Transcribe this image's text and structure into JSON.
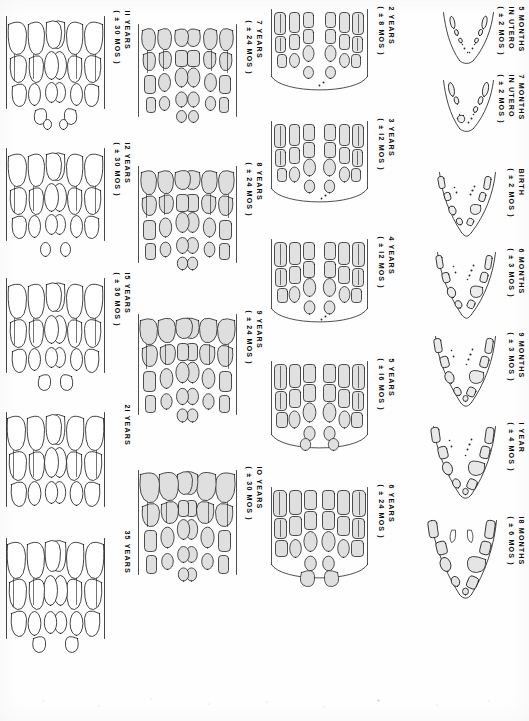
{
  "figure": {
    "orientation": "page rotated 90 degrees clockwise",
    "row_count": 4,
    "ink_color": "#111111",
    "paper_color": "#fefefe",
    "crown_fill": "#e2e2e2"
  },
  "rows": [
    {
      "row_index": 0,
      "name": "prenatal-and-infancy-row",
      "stages": [
        {
          "id": "s-5mo-utero",
          "line1": "5 MONTHS",
          "line2": "IN UTERO",
          "line3": "( ± 2 MOS )",
          "age_label": "5 MONTHS IN UTERO",
          "tolerance": "± 2 MOS"
        },
        {
          "id": "s-7mo-utero",
          "line1": "7 MONTHS",
          "line2": "IN UTERO",
          "line3": "( ± 2 MOS )",
          "age_label": "7 MONTHS IN UTERO",
          "tolerance": "± 2 MOS"
        },
        {
          "id": "s-birth",
          "line1": "BIRTH",
          "line2": "",
          "line3": "( ± 2 MOS )",
          "age_label": "BIRTH",
          "tolerance": "± 2 MOS"
        },
        {
          "id": "s-6mo",
          "line1": "6 MONTHS",
          "line2": "",
          "line3": "( ± 3 MOS )",
          "age_label": "6 MONTHS",
          "tolerance": "± 3 MOS"
        },
        {
          "id": "s-9mo",
          "line1": "9 MONTHS",
          "line2": "",
          "line3": "( ± 3 MOS )",
          "age_label": "9 MONTHS",
          "tolerance": "± 3 MOS"
        },
        {
          "id": "s-1yr",
          "line1": "I YEAR",
          "line2": "",
          "line3": "( ± 4 MOS )",
          "age_label": "I YEAR",
          "tolerance": "± 4 MOS"
        },
        {
          "id": "s-18mo",
          "line1": "I8 MONTHS",
          "line2": "",
          "line3": "( ± 6 MOS )",
          "age_label": "I8 MONTHS",
          "tolerance": "± 6 MOS"
        }
      ]
    },
    {
      "row_index": 1,
      "name": "early-childhood-row",
      "stages": [
        {
          "id": "s-2yr",
          "line1": "2 YEARS",
          "line2": "",
          "line3": "( ± 8 MOS )",
          "age_label": "2 YEARS",
          "tolerance": "± 8 MOS"
        },
        {
          "id": "s-3yr",
          "line1": "3 YEARS",
          "line2": "",
          "line3": "( ± I2 MOS )",
          "age_label": "3 YEARS",
          "tolerance": "± I2 MOS"
        },
        {
          "id": "s-4yr",
          "line1": "4 YEARS",
          "line2": "",
          "line3": "( ± I2 MOS )",
          "age_label": "4 YEARS",
          "tolerance": "± I2 MOS"
        },
        {
          "id": "s-5yr",
          "line1": "5 YEARS",
          "line2": "",
          "line3": "( ± I6 MOS )",
          "age_label": "5 YEARS",
          "tolerance": "± I6 MOS"
        },
        {
          "id": "s-6yr",
          "line1": "6 YEARS",
          "line2": "",
          "line3": "( ± 24 MOS )",
          "age_label": "6 YEARS",
          "tolerance": "± 24 MOS"
        }
      ]
    },
    {
      "row_index": 2,
      "name": "mixed-dentition-row",
      "stages": [
        {
          "id": "s-7yr",
          "line1": "7 YEARS",
          "line2": "",
          "line3": "( ± 24 MOS )",
          "age_label": "7 YEARS",
          "tolerance": "± 24 MOS"
        },
        {
          "id": "s-8yr",
          "line1": "8 YEARS",
          "line2": "",
          "line3": "( ± 24 MOS )",
          "age_label": "8 YEARS",
          "tolerance": "± 24 MOS"
        },
        {
          "id": "s-9yr",
          "line1": "9 YEARS",
          "line2": "",
          "line3": "( ± 24 MOS )",
          "age_label": "9 YEARS",
          "tolerance": "± 24 MOS"
        },
        {
          "id": "s-10yr",
          "line1": "IO YEARS",
          "line2": "",
          "line3": "( ± 30 MOS )",
          "age_label": "IO YEARS",
          "tolerance": "± 30 MOS"
        }
      ]
    },
    {
      "row_index": 3,
      "name": "permanent-dentition-row",
      "stages": [
        {
          "id": "s-11yr",
          "line1": "II YEARS",
          "line2": "",
          "line3": "( ± 30 MOS )",
          "age_label": "II YEARS",
          "tolerance": "± 30 MOS"
        },
        {
          "id": "s-12yr",
          "line1": "I2 YEARS",
          "line2": "",
          "line3": "( ± 30 MOS )",
          "age_label": "I2 YEARS",
          "tolerance": "± 30 MOS"
        },
        {
          "id": "s-15yr",
          "line1": "I5 YEARS",
          "line2": "",
          "line3": "( ± 36 MOS )",
          "age_label": "I5 YEARS",
          "tolerance": "± 36 MOS"
        },
        {
          "id": "s-21yr",
          "line1": "2I YEARS",
          "line2": "",
          "line3": "",
          "age_label": "2I YEARS",
          "tolerance": ""
        },
        {
          "id": "s-35yr",
          "line1": "35 YEARS",
          "line2": "",
          "line3": "",
          "age_label": "35 YEARS",
          "tolerance": ""
        }
      ]
    }
  ]
}
